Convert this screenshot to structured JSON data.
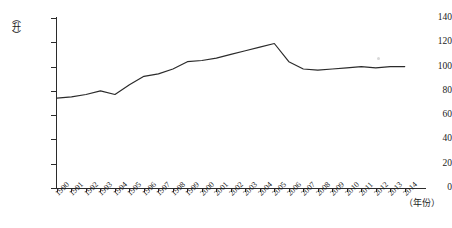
{
  "chart_data": {
    "type": "line",
    "title": "",
    "xlabel": "（年份）",
    "ylabel": "（升）",
    "ylim": [
      0,
      140
    ],
    "yticks": [
      0,
      20,
      40,
      60,
      80,
      100,
      120,
      140
    ],
    "grid": false,
    "legend": null,
    "categories": [
      "1990",
      "1991",
      "1992",
      "1993",
      "1994",
      "1995",
      "1996",
      "1997",
      "1998",
      "1999",
      "2000",
      "2001",
      "2002",
      "2003",
      "2004",
      "2005",
      "2006",
      "2007",
      "2008",
      "2009",
      "2010",
      "2011",
      "2012",
      "2013",
      "2014"
    ],
    "x": [
      1990,
      1991,
      1992,
      1993,
      1994,
      1995,
      1996,
      1997,
      1998,
      1999,
      2000,
      2001,
      2002,
      2003,
      2004,
      2005,
      2006,
      2007,
      2008,
      2009,
      2010,
      2011,
      2012,
      2013,
      2014
    ],
    "series": [
      {
        "name": "",
        "values": [
          74,
          75,
          77,
          80,
          77,
          85,
          92,
          94,
          98,
          104,
          105,
          107,
          110,
          113,
          116,
          119,
          104,
          98,
          97,
          98,
          99,
          100,
          99,
          100,
          100
        ]
      }
    ],
    "annotations": []
  },
  "axis": {
    "y_unit_label": "（升）",
    "x_unit_label": "（年份）",
    "y_tick_labels": [
      "0",
      "20",
      "40",
      "60",
      "80",
      "100",
      "120",
      "140"
    ]
  },
  "colors": {
    "line": "#2b2b2b",
    "axis": "#2b2b2b",
    "background": "#ffffff"
  }
}
